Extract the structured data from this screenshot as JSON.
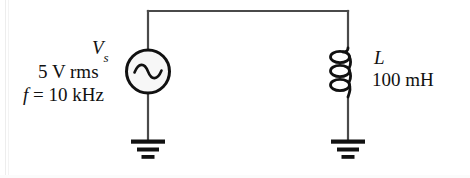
{
  "figure": {
    "width": 470,
    "height": 178,
    "background_color": "#ffffff",
    "wire_color": "#4a4a4a",
    "component_color": "#111111"
  },
  "source": {
    "type": "ac-voltage-source",
    "symbol_name": "sine-wave-source",
    "symbol_label": "V",
    "symbol_subscript": "s",
    "amplitude_label": "5 V rms",
    "frequency_label": "f = 10 kHz",
    "frequency_symbol": "f",
    "frequency_equals": " = ",
    "frequency_value": "10 kHz",
    "fill_color": "#f7f7f7",
    "outline_color": "#111111"
  },
  "inductor": {
    "type": "inductor",
    "symbol_name": "coil",
    "symbol_label": "L",
    "value_label": "100 mH",
    "turns": 3,
    "color": "#111111"
  },
  "ground": {
    "symbol_name": "earth-ground",
    "count": 2,
    "bar_widths": [
      34,
      22,
      13
    ],
    "color": "#111111"
  },
  "nodes": {
    "top_wire_y": 11,
    "left_branch_x": 148,
    "right_branch_x": 348
  }
}
